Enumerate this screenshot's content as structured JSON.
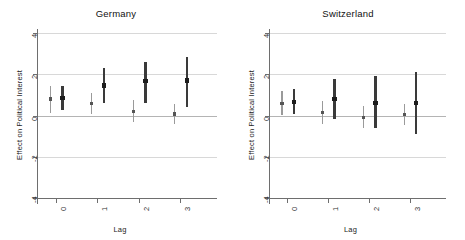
{
  "figure": {
    "ylabel": "Effect on Political Interest",
    "xlabel": "Lag",
    "ytick_labels": [
      "4",
      "2",
      "0",
      "-2",
      "-4"
    ],
    "ytick_values": [
      4,
      2,
      0,
      -2,
      -4
    ],
    "xtick_labels": [
      "0",
      "1",
      "2",
      "3"
    ],
    "xtick_values": [
      0,
      1,
      2,
      3
    ],
    "colors": {
      "light_series": "#9a9a9a",
      "dark_series": "#3a3a3a",
      "grid": "#d8d8d8",
      "zero_line": "#b4b4b4",
      "axis": "#6e6e6e",
      "text": "#222222"
    }
  },
  "chart_data": [
    {
      "type": "scatter",
      "title": "Germany",
      "xlabel": "Lag",
      "ylabel": "Effect on Political Interest",
      "ylim": [
        -4,
        4
      ],
      "xlim": [
        -0.45,
        3.55
      ],
      "grid": true,
      "legend": "none",
      "categories": [
        0,
        1,
        2,
        3
      ],
      "series": [
        {
          "name": "light",
          "style": "thin-line",
          "color": "#9a9a9a",
          "x": [
            -0.13,
            0.87,
            1.87,
            2.87
          ],
          "estimates": [
            0.8,
            0.57,
            0.2,
            0.07
          ],
          "ci_low": [
            0.13,
            0.08,
            -0.32,
            -0.4
          ],
          "ci_high": [
            1.42,
            1.1,
            0.75,
            0.55
          ]
        },
        {
          "name": "dark",
          "style": "thick-line",
          "color": "#3a3a3a",
          "x": [
            0.16,
            1.16,
            2.16,
            3.16
          ],
          "estimates": [
            0.85,
            1.45,
            1.68,
            1.7
          ],
          "ci_low": [
            0.27,
            0.62,
            0.62,
            0.42
          ],
          "ci_high": [
            1.45,
            2.32,
            2.6,
            2.85
          ]
        }
      ]
    },
    {
      "type": "scatter",
      "title": "Switzerland",
      "xlabel": "Lag",
      "ylabel": "Effect on Political Interest",
      "ylim": [
        -4,
        4
      ],
      "xlim": [
        -0.45,
        3.55
      ],
      "grid": true,
      "legend": "none",
      "categories": [
        0,
        1,
        2,
        3
      ],
      "series": [
        {
          "name": "light",
          "style": "thin-line",
          "color": "#9a9a9a",
          "x": [
            -0.13,
            0.87,
            1.87,
            2.87
          ],
          "estimates": [
            0.6,
            0.14,
            -0.1,
            0.04
          ],
          "ci_low": [
            0.02,
            -0.42,
            -0.62,
            -0.45
          ],
          "ci_high": [
            1.18,
            0.72,
            0.44,
            0.55
          ]
        },
        {
          "name": "dark",
          "style": "thick-line",
          "color": "#3a3a3a",
          "x": [
            0.16,
            1.16,
            2.16,
            3.16
          ],
          "estimates": [
            0.64,
            0.8,
            0.6,
            0.62
          ],
          "ci_low": [
            0.05,
            -0.18,
            -0.62,
            -0.9
          ],
          "ci_high": [
            1.28,
            1.78,
            1.9,
            2.1
          ]
        }
      ]
    }
  ]
}
